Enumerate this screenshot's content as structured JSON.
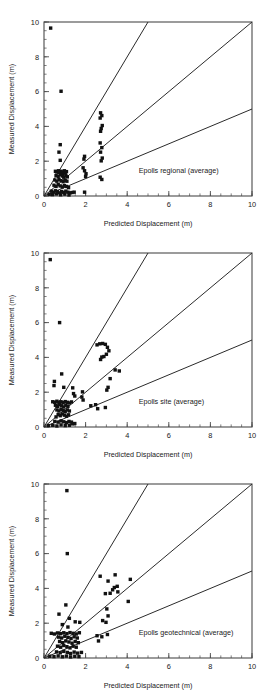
{
  "figure": {
    "title": "",
    "panel_count": 3
  },
  "chart_data": [
    {
      "type": "scatter",
      "title": "Epolls regional (average)",
      "annotation": "Epolls regional (average)",
      "xlabel": "Predicted Displacement (m)",
      "ylabel": "Measured Displacement (m)",
      "xlim": [
        0,
        10
      ],
      "ylim": [
        0,
        10
      ],
      "xticks": [
        0,
        2,
        4,
        6,
        8,
        10
      ],
      "yticks": [
        0,
        2,
        4,
        6,
        8,
        10
      ],
      "xticklabels": [
        "0",
        "2",
        "4",
        "6",
        "8",
        "10"
      ],
      "yticklabels": [
        "0",
        "2",
        "4",
        "6",
        "8",
        "10"
      ],
      "minor_tick_interval": 0.5,
      "grid": false,
      "legend": "none",
      "marker": "square",
      "marker_color": "#111111",
      "reference_lines": [
        {
          "name": "slope-2-line",
          "slope": 2,
          "intercept": 0,
          "x0": 0,
          "y0": 0,
          "x1": 5,
          "y1": 10
        },
        {
          "name": "slope-1-line",
          "slope": 1,
          "intercept": 0,
          "x0": 0,
          "y0": 0,
          "x1": 10,
          "y1": 10
        },
        {
          "name": "slope-0.5-line",
          "slope": 0.5,
          "intercept": 0,
          "x0": 0,
          "y0": 0,
          "x1": 10,
          "y1": 5
        }
      ],
      "points": [
        [
          0.32,
          9.65
        ],
        [
          0.82,
          6.02
        ],
        [
          0.78,
          2.95
        ],
        [
          0.72,
          2.52
        ],
        [
          0.78,
          2.05
        ],
        [
          1.95,
          2.28
        ],
        [
          1.92,
          2.12
        ],
        [
          1.88,
          1.62
        ],
        [
          1.95,
          1.45
        ],
        [
          2.02,
          1.28
        ],
        [
          2.0,
          1.12
        ],
        [
          1.95,
          0.22
        ],
        [
          2.72,
          4.78
        ],
        [
          2.78,
          4.62
        ],
        [
          2.7,
          4.48
        ],
        [
          2.8,
          4.05
        ],
        [
          2.75,
          3.88
        ],
        [
          2.72,
          3.72
        ],
        [
          2.7,
          3.05
        ],
        [
          2.78,
          2.78
        ],
        [
          2.72,
          2.52
        ],
        [
          2.8,
          2.18
        ],
        [
          2.75,
          2.02
        ],
        [
          2.7,
          1.08
        ],
        [
          2.78,
          0.95
        ],
        [
          0.55,
          1.42
        ],
        [
          0.62,
          1.38
        ],
        [
          0.7,
          1.45
        ],
        [
          0.75,
          1.35
        ],
        [
          0.82,
          1.42
        ],
        [
          0.88,
          1.3
        ],
        [
          0.92,
          1.38
        ],
        [
          0.98,
          1.45
        ],
        [
          1.02,
          1.32
        ],
        [
          1.08,
          1.4
        ],
        [
          0.58,
          1.18
        ],
        [
          0.68,
          1.12
        ],
        [
          0.78,
          1.22
        ],
        [
          0.88,
          1.15
        ],
        [
          0.95,
          1.08
        ],
        [
          1.05,
          1.18
        ],
        [
          1.12,
          1.1
        ],
        [
          0.52,
          0.92
        ],
        [
          0.62,
          0.85
        ],
        [
          0.72,
          0.95
        ],
        [
          0.82,
          0.88
        ],
        [
          0.92,
          0.82
        ],
        [
          1.02,
          0.9
        ],
        [
          1.1,
          0.85
        ],
        [
          0.48,
          0.62
        ],
        [
          0.58,
          0.55
        ],
        [
          0.68,
          0.65
        ],
        [
          0.78,
          0.58
        ],
        [
          0.88,
          0.52
        ],
        [
          0.98,
          0.6
        ],
        [
          1.08,
          0.55
        ],
        [
          1.18,
          0.48
        ],
        [
          0.35,
          0.28
        ],
        [
          0.45,
          0.22
        ],
        [
          0.55,
          0.3
        ],
        [
          0.65,
          0.25
        ],
        [
          0.75,
          0.18
        ],
        [
          0.85,
          0.26
        ],
        [
          0.95,
          0.2
        ],
        [
          1.05,
          0.28
        ],
        [
          1.15,
          0.22
        ],
        [
          1.25,
          0.18
        ],
        [
          0.25,
          0.1
        ],
        [
          0.4,
          0.08
        ],
        [
          0.6,
          0.12
        ],
        [
          0.8,
          0.07
        ],
        [
          1.0,
          0.11
        ],
        [
          1.2,
          0.06
        ],
        [
          1.35,
          0.2
        ],
        [
          1.45,
          0.22
        ]
      ]
    },
    {
      "type": "scatter",
      "title": "Epolls site (average)",
      "annotation": "Epolls site (average)",
      "xlabel": "Predicted Displacement (m)",
      "ylabel": "Measured Displacement (m)",
      "xlim": [
        0,
        10
      ],
      "ylim": [
        0,
        10
      ],
      "xticks": [
        0,
        2,
        4,
        6,
        8,
        10
      ],
      "yticks": [
        0,
        2,
        4,
        6,
        8,
        10
      ],
      "xticklabels": [
        "0",
        "2",
        "4",
        "6",
        "8",
        "10"
      ],
      "yticklabels": [
        "0",
        "2",
        "4",
        "6",
        "8",
        "10"
      ],
      "minor_tick_interval": 0.5,
      "grid": false,
      "legend": "none",
      "marker": "square",
      "marker_color": "#111111",
      "reference_lines": [
        {
          "name": "slope-2-line",
          "slope": 2,
          "intercept": 0,
          "x0": 0,
          "y0": 0,
          "x1": 5,
          "y1": 10
        },
        {
          "name": "slope-1-line",
          "slope": 1,
          "intercept": 0,
          "x0": 0,
          "y0": 0,
          "x1": 10,
          "y1": 10
        },
        {
          "name": "slope-0.5-line",
          "slope": 0.5,
          "intercept": 0,
          "x0": 0,
          "y0": 0,
          "x1": 10,
          "y1": 5
        }
      ],
      "points": [
        [
          0.3,
          9.62
        ],
        [
          0.75,
          6.0
        ],
        [
          0.85,
          3.05
        ],
        [
          0.5,
          2.62
        ],
        [
          0.48,
          2.38
        ],
        [
          0.95,
          2.28
        ],
        [
          1.38,
          2.25
        ],
        [
          1.42,
          1.92
        ],
        [
          1.48,
          1.78
        ],
        [
          1.85,
          2.02
        ],
        [
          1.82,
          1.72
        ],
        [
          1.88,
          1.55
        ],
        [
          2.55,
          4.72
        ],
        [
          2.68,
          4.78
        ],
        [
          2.82,
          4.8
        ],
        [
          2.95,
          4.75
        ],
        [
          3.05,
          4.58
        ],
        [
          3.12,
          4.38
        ],
        [
          3.0,
          4.18
        ],
        [
          2.88,
          4.05
        ],
        [
          2.78,
          4.02
        ],
        [
          2.72,
          3.88
        ],
        [
          3.42,
          3.28
        ],
        [
          3.62,
          3.22
        ],
        [
          3.18,
          2.78
        ],
        [
          3.08,
          2.28
        ],
        [
          3.02,
          2.12
        ],
        [
          2.48,
          1.28
        ],
        [
          2.58,
          1.05
        ],
        [
          2.95,
          1.12
        ],
        [
          2.25,
          1.22
        ],
        [
          0.42,
          1.45
        ],
        [
          0.52,
          1.42
        ],
        [
          0.62,
          1.48
        ],
        [
          0.72,
          1.42
        ],
        [
          0.82,
          1.45
        ],
        [
          0.92,
          1.4
        ],
        [
          1.02,
          1.46
        ],
        [
          1.12,
          1.42
        ],
        [
          1.22,
          1.38
        ],
        [
          1.32,
          1.44
        ],
        [
          0.55,
          1.25
        ],
        [
          0.65,
          1.18
        ],
        [
          0.75,
          1.28
        ],
        [
          0.85,
          1.22
        ],
        [
          0.95,
          1.15
        ],
        [
          1.05,
          1.25
        ],
        [
          1.15,
          1.18
        ],
        [
          0.62,
          0.98
        ],
        [
          0.72,
          0.92
        ],
        [
          0.82,
          1.02
        ],
        [
          0.92,
          0.95
        ],
        [
          1.02,
          0.88
        ],
        [
          1.12,
          0.98
        ],
        [
          1.22,
          0.92
        ],
        [
          0.68,
          0.72
        ],
        [
          0.78,
          0.65
        ],
        [
          0.88,
          0.75
        ],
        [
          0.98,
          0.68
        ],
        [
          1.08,
          0.62
        ],
        [
          1.18,
          0.7
        ],
        [
          0.58,
          0.58
        ],
        [
          0.52,
          0.32
        ],
        [
          0.68,
          0.28
        ],
        [
          0.82,
          0.35
        ],
        [
          0.95,
          0.3
        ],
        [
          1.08,
          0.25
        ],
        [
          1.2,
          0.32
        ],
        [
          1.32,
          0.28
        ],
        [
          0.22,
          0.08
        ],
        [
          0.42,
          0.1
        ],
        [
          0.62,
          0.06
        ],
        [
          0.82,
          0.12
        ],
        [
          1.02,
          0.08
        ],
        [
          1.22,
          0.1
        ],
        [
          1.38,
          0.18
        ],
        [
          1.48,
          0.2
        ]
      ]
    },
    {
      "type": "scatter",
      "title": "Epolls geotechnical (average)",
      "annotation": "Epolls geotechnical (average)",
      "xlabel": "Predicted Displacement (m)",
      "ylabel": "Measured Displacement (m)",
      "xlim": [
        0,
        10
      ],
      "ylim": [
        0,
        10
      ],
      "xticks": [
        0,
        2,
        4,
        6,
        8,
        10
      ],
      "yticks": [
        0,
        2,
        4,
        6,
        8,
        10
      ],
      "xticklabels": [
        "0",
        "2",
        "4",
        "6",
        "8",
        "10"
      ],
      "yticklabels": [
        "0",
        "2",
        "4",
        "6",
        "8",
        "10"
      ],
      "minor_tick_interval": 0.5,
      "grid": false,
      "legend": "none",
      "marker": "square",
      "marker_color": "#111111",
      "reference_lines": [
        {
          "name": "slope-2-line",
          "slope": 2,
          "intercept": 0,
          "x0": 0,
          "y0": 0,
          "x1": 5,
          "y1": 10
        },
        {
          "name": "slope-1-line",
          "slope": 1,
          "intercept": 0,
          "x0": 0,
          "y0": 0,
          "x1": 10,
          "y1": 10
        },
        {
          "name": "slope-0.5-line",
          "slope": 0.5,
          "intercept": 0,
          "x0": 0,
          "y0": 0,
          "x1": 10,
          "y1": 5
        }
      ],
      "points": [
        [
          1.1,
          9.62
        ],
        [
          1.12,
          6.0
        ],
        [
          1.05,
          3.05
        ],
        [
          0.72,
          2.52
        ],
        [
          1.22,
          2.28
        ],
        [
          1.5,
          2.08
        ],
        [
          1.72,
          2.05
        ],
        [
          0.88,
          1.92
        ],
        [
          1.15,
          1.78
        ],
        [
          2.7,
          4.7
        ],
        [
          3.08,
          4.42
        ],
        [
          3.42,
          4.78
        ],
        [
          4.15,
          4.52
        ],
        [
          3.52,
          4.12
        ],
        [
          3.38,
          4.05
        ],
        [
          3.3,
          3.92
        ],
        [
          3.55,
          3.8
        ],
        [
          3.18,
          3.72
        ],
        [
          2.95,
          3.7
        ],
        [
          4.05,
          3.25
        ],
        [
          3.02,
          2.82
        ],
        [
          3.08,
          2.42
        ],
        [
          2.82,
          2.15
        ],
        [
          2.98,
          2.05
        ],
        [
          2.55,
          1.28
        ],
        [
          2.78,
          1.22
        ],
        [
          3.05,
          1.35
        ],
        [
          2.62,
          0.98
        ],
        [
          0.35,
          1.42
        ],
        [
          0.5,
          1.38
        ],
        [
          0.65,
          1.44
        ],
        [
          0.8,
          1.4
        ],
        [
          0.95,
          1.45
        ],
        [
          1.1,
          1.4
        ],
        [
          1.25,
          1.46
        ],
        [
          1.4,
          1.42
        ],
        [
          1.55,
          1.38
        ],
        [
          1.7,
          1.45
        ],
        [
          0.7,
          1.2
        ],
        [
          0.85,
          1.15
        ],
        [
          1.0,
          1.25
        ],
        [
          1.15,
          1.18
        ],
        [
          1.3,
          1.12
        ],
        [
          1.45,
          1.22
        ],
        [
          1.6,
          1.15
        ],
        [
          0.75,
          0.95
        ],
        [
          0.9,
          0.88
        ],
        [
          1.05,
          0.98
        ],
        [
          1.2,
          0.92
        ],
        [
          1.35,
          0.85
        ],
        [
          1.5,
          0.95
        ],
        [
          1.65,
          0.88
        ],
        [
          0.65,
          0.68
        ],
        [
          0.8,
          0.62
        ],
        [
          0.95,
          0.72
        ],
        [
          1.1,
          0.65
        ],
        [
          1.25,
          0.58
        ],
        [
          1.4,
          0.68
        ],
        [
          1.55,
          0.62
        ],
        [
          0.6,
          0.35
        ],
        [
          0.78,
          0.3
        ],
        [
          0.95,
          0.38
        ],
        [
          1.12,
          0.32
        ],
        [
          1.28,
          0.26
        ],
        [
          1.45,
          0.34
        ],
        [
          1.62,
          0.28
        ],
        [
          1.8,
          0.32
        ],
        [
          0.28,
          0.1
        ],
        [
          0.48,
          0.08
        ],
        [
          0.68,
          0.12
        ],
        [
          0.88,
          0.07
        ],
        [
          1.08,
          0.11
        ],
        [
          1.28,
          0.06
        ],
        [
          1.48,
          0.1
        ],
        [
          1.68,
          0.08
        ]
      ]
    }
  ]
}
